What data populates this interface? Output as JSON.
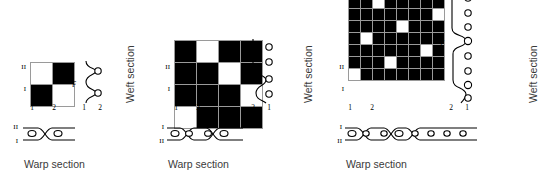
{
  "figure": {
    "background_color": "#ffffff",
    "ink_color": "#000000",
    "grid_line_color": "#9a9a9a",
    "label_color": "#3a3a3a"
  },
  "common": {
    "weft_section_label": "Weft section",
    "warp_section_label": "Warp section",
    "float_label": "F",
    "harness_labels": [
      "I",
      "II"
    ],
    "column_labels": [
      "1",
      "2"
    ],
    "weft_axis_labels": [
      "2",
      "1"
    ]
  },
  "panels": [
    {
      "id": "plain-weave",
      "name": "plain weave",
      "grid": {
        "rows": 2,
        "cols": 2,
        "note": "1 = warp up (black square), 0 = weft up (white square); row 0 is the bottom row",
        "matrix": [
          [
            1,
            0
          ],
          [
            0,
            1
          ]
        ]
      },
      "row_labels_bottom_to_top": [
        "I",
        "II"
      ],
      "column_labels_left_to_right": [
        "1",
        "2"
      ],
      "weft_section": {
        "label": "F",
        "axis_labels_left_to_right": [
          "1",
          "2"
        ],
        "yarn_count": 2,
        "interlacings": 2
      },
      "warp_section": {
        "row_labels_top_to_bottom": [
          "II",
          "I"
        ],
        "yarn_count": 2,
        "crossings": 1
      },
      "captions": {
        "weft": "Weft section",
        "warp": "Warp section"
      }
    },
    {
      "id": "twill-weave",
      "name": "twill weave",
      "grid": {
        "rows": 4,
        "cols": 4,
        "note": "1 = warp up (black square), 0 = weft up (white square); row 0 is the bottom row",
        "matrix": [
          [
            0,
            1,
            1,
            1
          ],
          [
            1,
            1,
            1,
            0
          ],
          [
            1,
            1,
            0,
            1
          ],
          [
            1,
            0,
            1,
            1
          ]
        ]
      },
      "row_labels_bottom_to_top": [
        "I",
        "II"
      ],
      "column_labels_left_to_right": [
        "1",
        "2"
      ],
      "weft_section": {
        "label": "F",
        "axis_labels_left_to_right": [
          "2",
          "1"
        ],
        "yarn_count": 4,
        "interlacings": 2
      },
      "warp_section": {
        "row_labels_top_to_bottom": [
          "I",
          "II"
        ],
        "yarn_count": 4,
        "crossings": 2
      },
      "captions": {
        "weft": "Weft section",
        "warp": "Warp section"
      }
    },
    {
      "id": "satin-weave",
      "name": "satin weave",
      "grid": {
        "rows": 8,
        "cols": 8,
        "note": "1 = warp up (black square), 0 = weft up (white square); row 0 is the bottom row",
        "matrix": [
          [
            0,
            1,
            1,
            1,
            1,
            1,
            1,
            1
          ],
          [
            1,
            1,
            1,
            0,
            1,
            1,
            1,
            1
          ],
          [
            1,
            1,
            1,
            1,
            1,
            1,
            0,
            1
          ],
          [
            1,
            0,
            1,
            1,
            1,
            1,
            1,
            1
          ],
          [
            1,
            1,
            1,
            1,
            0,
            1,
            1,
            1
          ],
          [
            1,
            1,
            1,
            1,
            1,
            1,
            1,
            0
          ],
          [
            1,
            1,
            0,
            1,
            1,
            1,
            1,
            1
          ],
          [
            1,
            1,
            1,
            1,
            1,
            0,
            1,
            1
          ]
        ]
      },
      "row_labels_bottom_to_top": [
        "I",
        "II"
      ],
      "column_labels_left_to_right": [
        "1",
        "2"
      ],
      "weft_section": {
        "label": "F",
        "axis_labels_left_to_right": [
          "2",
          "1"
        ],
        "yarn_count": 8,
        "interlacings": 2
      },
      "warp_section": {
        "row_labels_top_to_bottom": [
          "I",
          "II"
        ],
        "yarn_count": 8,
        "crossings": 2
      },
      "captions": {
        "weft": "Weft section",
        "warp": "Warp section"
      }
    }
  ]
}
